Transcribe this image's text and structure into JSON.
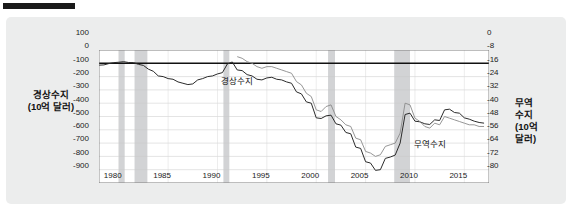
{
  "figure": {
    "redacted_title": "",
    "background_color": "#eceded",
    "plot_background_color": "#ffffff"
  },
  "axes": {
    "left_title_line1": "경상수지",
    "left_title_line2": "(10억 달러)",
    "right_title_line1": "무역",
    "right_title_line2": "수지",
    "right_title_line3": "(10억",
    "right_title_line4": "달러)"
  },
  "chart_data": {
    "type": "line",
    "title": "",
    "xlabel": "",
    "ylabel": "경상수지 (10억 달러)",
    "y2label": "무역수지 (10억 달러)",
    "grid": true,
    "legend": "inline-annotations",
    "xlim": [
      1978,
      2017.5
    ],
    "ylim": [
      -900,
      100
    ],
    "y2lim": [
      -80,
      0
    ],
    "xticks": [
      1980,
      1985,
      1990,
      1995,
      2000,
      2005,
      2010,
      2015
    ],
    "xticklabels": [
      "1980",
      "1985",
      "1990",
      "1995",
      "2000",
      "2005",
      "2010",
      "2015"
    ],
    "yticks": [
      100,
      0,
      -100,
      -200,
      -300,
      -400,
      -500,
      -600,
      -700,
      -800,
      -900
    ],
    "yticklabels": [
      "100",
      "0",
      "-100",
      "-200",
      "-300",
      "-400",
      "-500",
      "-600",
      "-700",
      "-800",
      "-900"
    ],
    "y2ticks": [
      0,
      -8,
      -16,
      -24,
      -32,
      -40,
      -48,
      -56,
      -64,
      -72,
      -80
    ],
    "y2ticklabels": [
      "0",
      "-8",
      "-16",
      "-24",
      "-32",
      "-40",
      "-48",
      "-56",
      "-64",
      "-72",
      "-80"
    ],
    "zero_line": 0,
    "recession_bands": [
      {
        "start": 1980.0,
        "end": 1980.6
      },
      {
        "start": 1981.6,
        "end": 1982.9
      },
      {
        "start": 1990.6,
        "end": 1991.2
      },
      {
        "start": 2001.2,
        "end": 2001.9
      },
      {
        "start": 2007.9,
        "end": 2009.5
      }
    ],
    "recession_band_color": "#d2d3d5",
    "series": [
      {
        "name": "경상수지",
        "axis": "left",
        "color": "#2b2b2b",
        "annotation": "경상수지",
        "annotation_x": 1993.0,
        "annotation_y": -255,
        "x": [
          1978.0,
          1978.5,
          1979.0,
          1979.5,
          1980.0,
          1980.5,
          1981.0,
          1981.5,
          1982.0,
          1982.5,
          1983.0,
          1983.5,
          1984.0,
          1984.5,
          1985.0,
          1985.5,
          1986.0,
          1986.5,
          1987.0,
          1987.5,
          1988.0,
          1988.5,
          1989.0,
          1989.5,
          1990.0,
          1990.5,
          1991.0,
          1991.5,
          1992.0,
          1992.5,
          1993.0,
          1993.5,
          1994.0,
          1994.5,
          1995.0,
          1995.5,
          1996.0,
          1996.5,
          1997.0,
          1997.5,
          1998.0,
          1998.5,
          1999.0,
          1999.5,
          2000.0,
          2000.5,
          2001.0,
          2001.5,
          2002.0,
          2002.5,
          2003.0,
          2003.5,
          2004.0,
          2004.5,
          2005.0,
          2005.5,
          2006.0,
          2006.5,
          2007.0,
          2007.5,
          2008.0,
          2008.5,
          2009.0,
          2009.5,
          2010.0,
          2010.5,
          2011.0,
          2011.5,
          2012.0,
          2012.5,
          2013.0,
          2013.5,
          2014.0,
          2014.5,
          2015.0,
          2015.5,
          2016.0,
          2016.5,
          2017.0
        ],
        "y": [
          -14,
          -12,
          -2,
          5,
          8,
          12,
          6,
          5,
          -8,
          -16,
          -44,
          -60,
          -95,
          -100,
          -115,
          -120,
          -140,
          -150,
          -160,
          -155,
          -125,
          -115,
          -100,
          -95,
          -80,
          -70,
          -5,
          10,
          -50,
          -55,
          -85,
          -95,
          -120,
          -125,
          -110,
          -105,
          -120,
          -125,
          -140,
          -150,
          -215,
          -230,
          -290,
          -300,
          -410,
          -415,
          -395,
          -390,
          -455,
          -465,
          -520,
          -530,
          -630,
          -640,
          -740,
          -750,
          -805,
          -800,
          -715,
          -705,
          -690,
          -600,
          -385,
          -375,
          -435,
          -440,
          -455,
          -460,
          -425,
          -430,
          -350,
          -345,
          -370,
          -375,
          -410,
          -420,
          -435,
          -445,
          -450
        ]
      },
      {
        "name": "무역수지",
        "axis": "right",
        "color": "#8a8a8a",
        "annotation": "무역수지",
        "annotation_x": 2012.5,
        "annotation_y_right": -66,
        "x": [
          1992.0,
          1992.5,
          1993.0,
          1993.5,
          1994.0,
          1994.5,
          1995.0,
          1995.5,
          1996.0,
          1996.5,
          1997.0,
          1997.5,
          1998.0,
          1998.5,
          1999.0,
          1999.5,
          2000.0,
          2000.5,
          2001.0,
          2001.5,
          2002.0,
          2002.5,
          2003.0,
          2003.5,
          2004.0,
          2004.5,
          2005.0,
          2005.5,
          2006.0,
          2006.5,
          2007.0,
          2007.5,
          2008.0,
          2008.5,
          2009.0,
          2009.5,
          2010.0,
          2010.5,
          2011.0,
          2011.5,
          2012.0,
          2012.5,
          2013.0,
          2013.5,
          2014.0,
          2014.5,
          2015.0,
          2015.5,
          2016.0,
          2016.5,
          2017.0
        ],
        "y": [
          -4,
          -5,
          -7,
          -8,
          -10,
          -11,
          -10,
          -10,
          -11,
          -12,
          -13,
          -14,
          -19,
          -21,
          -26,
          -28,
          -36,
          -37,
          -34,
          -33,
          -40,
          -42,
          -45,
          -46,
          -53,
          -54,
          -61,
          -62,
          -64,
          -63,
          -58,
          -57,
          -56,
          -50,
          -32,
          -33,
          -41,
          -43,
          -46,
          -47,
          -44,
          -45,
          -40,
          -41,
          -42,
          -43,
          -44,
          -45,
          -45,
          -46,
          -46
        ]
      }
    ]
  }
}
